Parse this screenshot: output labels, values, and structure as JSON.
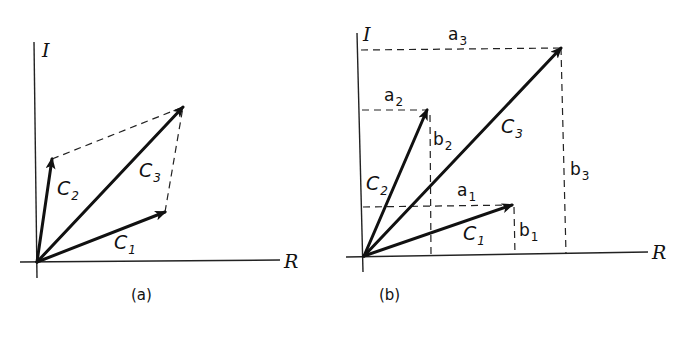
{
  "figure": {
    "stroke_color": "#111111",
    "background": "#ffffff",
    "panels": [
      {
        "id": "a",
        "caption": "(a)",
        "caption_pos": [
          131,
          300
        ],
        "origin": [
          37,
          262
        ],
        "axes": {
          "real": {
            "label": "R",
            "from": [
              20,
              262
            ],
            "to": [
              280,
              260
            ],
            "label_pos": [
              284,
              268
            ]
          },
          "imag": {
            "label": "I",
            "from": [
              34,
              42
            ],
            "to": [
              37,
              278
            ],
            "label_pos": [
              42,
              57
            ]
          }
        },
        "vectors": [
          {
            "name": "C",
            "sub": "1",
            "tip": [
              165,
              212
            ],
            "label_pos": [
              114,
              249
            ]
          },
          {
            "name": "C",
            "sub": "2",
            "tip": [
              52,
              159
            ],
            "label_pos": [
              57,
              195
            ]
          },
          {
            "name": "C",
            "sub": "3",
            "tip": [
              183,
              107
            ],
            "label_pos": [
              139,
              177
            ]
          }
        ],
        "dashed_lines": [
          {
            "from": [
              52,
              159
            ],
            "to": [
              183,
              107
            ]
          },
          {
            "from": [
              165,
              212
            ],
            "to": [
              183,
              107
            ]
          }
        ],
        "component_labels": []
      },
      {
        "id": "b",
        "caption": "(b)",
        "caption_pos": [
          379,
          300
        ],
        "origin": [
          364,
          256
        ],
        "axes": {
          "real": {
            "label": "R",
            "from": [
              346,
              257
            ],
            "to": [
              648,
              252
            ],
            "label_pos": [
              652,
              259
            ]
          },
          "imag": {
            "label": "I",
            "from": [
              357,
              33
            ],
            "to": [
              363,
              272
            ],
            "label_pos": [
              363,
              41
            ]
          }
        },
        "vectors": [
          {
            "name": "C",
            "sub": "1",
            "tip": [
              512,
              205
            ],
            "label_pos": [
              463,
              240
            ]
          },
          {
            "name": "C",
            "sub": "2",
            "tip": [
              427,
              110
            ],
            "label_pos": [
              366,
              190
            ]
          },
          {
            "name": "C",
            "sub": "3",
            "tip": [
              561,
              48
            ],
            "label_pos": [
              501,
              133
            ]
          }
        ],
        "dashed_lines": [
          {
            "from": [
              361,
              50
            ],
            "to": [
              561,
              48
            ]
          },
          {
            "from": [
              561,
              48
            ],
            "to": [
              566,
              254
            ]
          },
          {
            "from": [
              362,
              110
            ],
            "to": [
              427,
              110
            ]
          },
          {
            "from": [
              430,
              115
            ],
            "to": [
              431,
              255
            ]
          },
          {
            "from": [
              363,
              207
            ],
            "to": [
              512,
              205
            ]
          },
          {
            "from": [
              514,
              207
            ],
            "to": [
              515,
              255
            ]
          }
        ],
        "component_labels": [
          {
            "name": "a",
            "sub": "3",
            "pos": [
              448,
              40
            ]
          },
          {
            "name": "a",
            "sub": "2",
            "pos": [
              384,
              101
            ]
          },
          {
            "name": "b",
            "sub": "2",
            "pos": [
              433,
              145
            ]
          },
          {
            "name": "b",
            "sub": "3",
            "pos": [
              570,
              175
            ]
          },
          {
            "name": "a",
            "sub": "1",
            "pos": [
              457,
              196
            ]
          },
          {
            "name": "b",
            "sub": "1",
            "pos": [
              519,
              236
            ]
          }
        ]
      }
    ]
  }
}
